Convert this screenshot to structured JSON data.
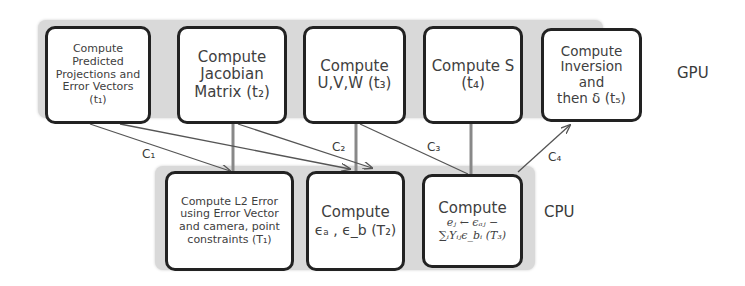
{
  "gpu": {
    "label": "GPU",
    "tasks": [
      {
        "id": "t1",
        "lines": [
          "Compute",
          "Predicted",
          "Projections and",
          "Error Vectors",
          "(t₁)"
        ]
      },
      {
        "id": "t2",
        "lines": [
          "Compute",
          "Jacobian",
          "Matrix (t₂)"
        ]
      },
      {
        "id": "t3",
        "lines": [
          "Compute",
          "U,V,W (t₃)"
        ]
      },
      {
        "id": "t4",
        "lines": [
          "Compute S",
          "(t₄)"
        ]
      },
      {
        "id": "t5",
        "lines": [
          "Compute",
          "Inversion",
          "and",
          "then δ (t₅)"
        ]
      }
    ]
  },
  "cpu": {
    "label": "CPU",
    "tasks": [
      {
        "id": "T1",
        "lines": [
          "Compute L2 Error",
          "using Error Vector",
          "and camera, point",
          "constraints (T₁)"
        ]
      },
      {
        "id": "T2",
        "lines": [
          "Compute",
          "ϵₐ , ϵ_b (T₂)"
        ]
      },
      {
        "id": "T3",
        "lines": [
          "Compute",
          "eⱼ ← ϵₐⱼ −",
          "∑ᵢYᵢⱼϵ_bᵢ (T₃)"
        ]
      }
    ]
  },
  "connections": {
    "c1": "C₁",
    "c2": "C₂",
    "c3": "C₃",
    "c4": "C₄"
  },
  "colors": {
    "panel": "#d9d9d9",
    "box_border": "#222222",
    "wire": "#555555",
    "vertical_wire": "#888888"
  }
}
